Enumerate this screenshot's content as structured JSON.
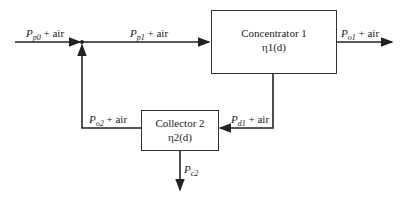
{
  "diagram": {
    "nodes": [
      {
        "id": "concentrator",
        "title": "Concentrator 1",
        "eff": "η1(d)"
      },
      {
        "id": "collector",
        "title": "Collector 2",
        "eff": "η2(d)"
      }
    ],
    "labels": {
      "p0": {
        "sym": "P",
        "sub": "p0",
        "suffix": " + air"
      },
      "p1": {
        "sym": "P",
        "sub": "p1",
        "suffix": " + air"
      },
      "o1": {
        "sym": "P",
        "sub": "o1",
        "suffix": " + air"
      },
      "d1": {
        "sym": "P",
        "sub": "d1",
        "suffix": " + air"
      },
      "o2": {
        "sym": "P",
        "sub": "o2",
        "suffix": " + air"
      },
      "c2": {
        "sym": "P",
        "sub": "c2",
        "suffix": ""
      }
    },
    "edges": [
      {
        "from": "input",
        "to": "junction",
        "label": "Pp0 + air"
      },
      {
        "from": "junction",
        "to": "concentrator",
        "label": "Pp1 + air"
      },
      {
        "from": "concentrator",
        "to": "output",
        "label": "Po1 + air"
      },
      {
        "from": "concentrator",
        "to": "collector",
        "label": "Pd1 + air"
      },
      {
        "from": "collector",
        "to": "junction",
        "label": "Po2 + air"
      },
      {
        "from": "collector",
        "to": "collected",
        "label": "Pc2"
      }
    ]
  }
}
